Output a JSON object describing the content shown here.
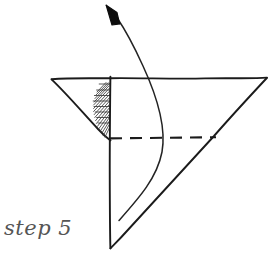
{
  "figure": {
    "title": "step 5",
    "caption": "step 5",
    "style": "hand-drawn sketch",
    "background_color": "#ffffff",
    "ink_color": "#1b1b1b",
    "caption_color": "#555555",
    "canvas": {
      "width": 272,
      "height": 257
    },
    "elements": {
      "top_edge": {
        "name": "top-horizontal-edge",
        "label": "top edge",
        "from": [
          51,
          79
        ],
        "to": [
          267,
          78
        ]
      },
      "vertical_fold": {
        "name": "vertical-center-line",
        "label": "vertical crease",
        "from": [
          110,
          77
        ],
        "to": [
          110,
          248
        ]
      },
      "left_flap": {
        "name": "left-flap-diagonal",
        "label": "left flap edge",
        "from": [
          51,
          79
        ],
        "to": [
          110,
          140
        ]
      },
      "right_diagonal": {
        "name": "right-diagonal-edge",
        "label": "right edge",
        "from": [
          267,
          78
        ],
        "to": [
          110,
          248
        ]
      },
      "dashed_fold": {
        "name": "dashed-fold-line",
        "label": "hidden fold line",
        "from": [
          110,
          138
        ],
        "to": [
          216,
          137
        ],
        "dash_pattern": "12 8"
      },
      "hatched_wedge": {
        "name": "hatched-wedge",
        "label": "shaded wedge",
        "hatch_direction": "lower-left to upper-right",
        "line_count": 16
      },
      "curved_arrow": {
        "name": "fold-direction-arrow",
        "label": "fold direction",
        "tail": [
          119,
          220
        ],
        "tip": [
          107,
          6
        ],
        "bulge_x": 163,
        "arrowhead": "solid-filled-triangle"
      }
    }
  }
}
